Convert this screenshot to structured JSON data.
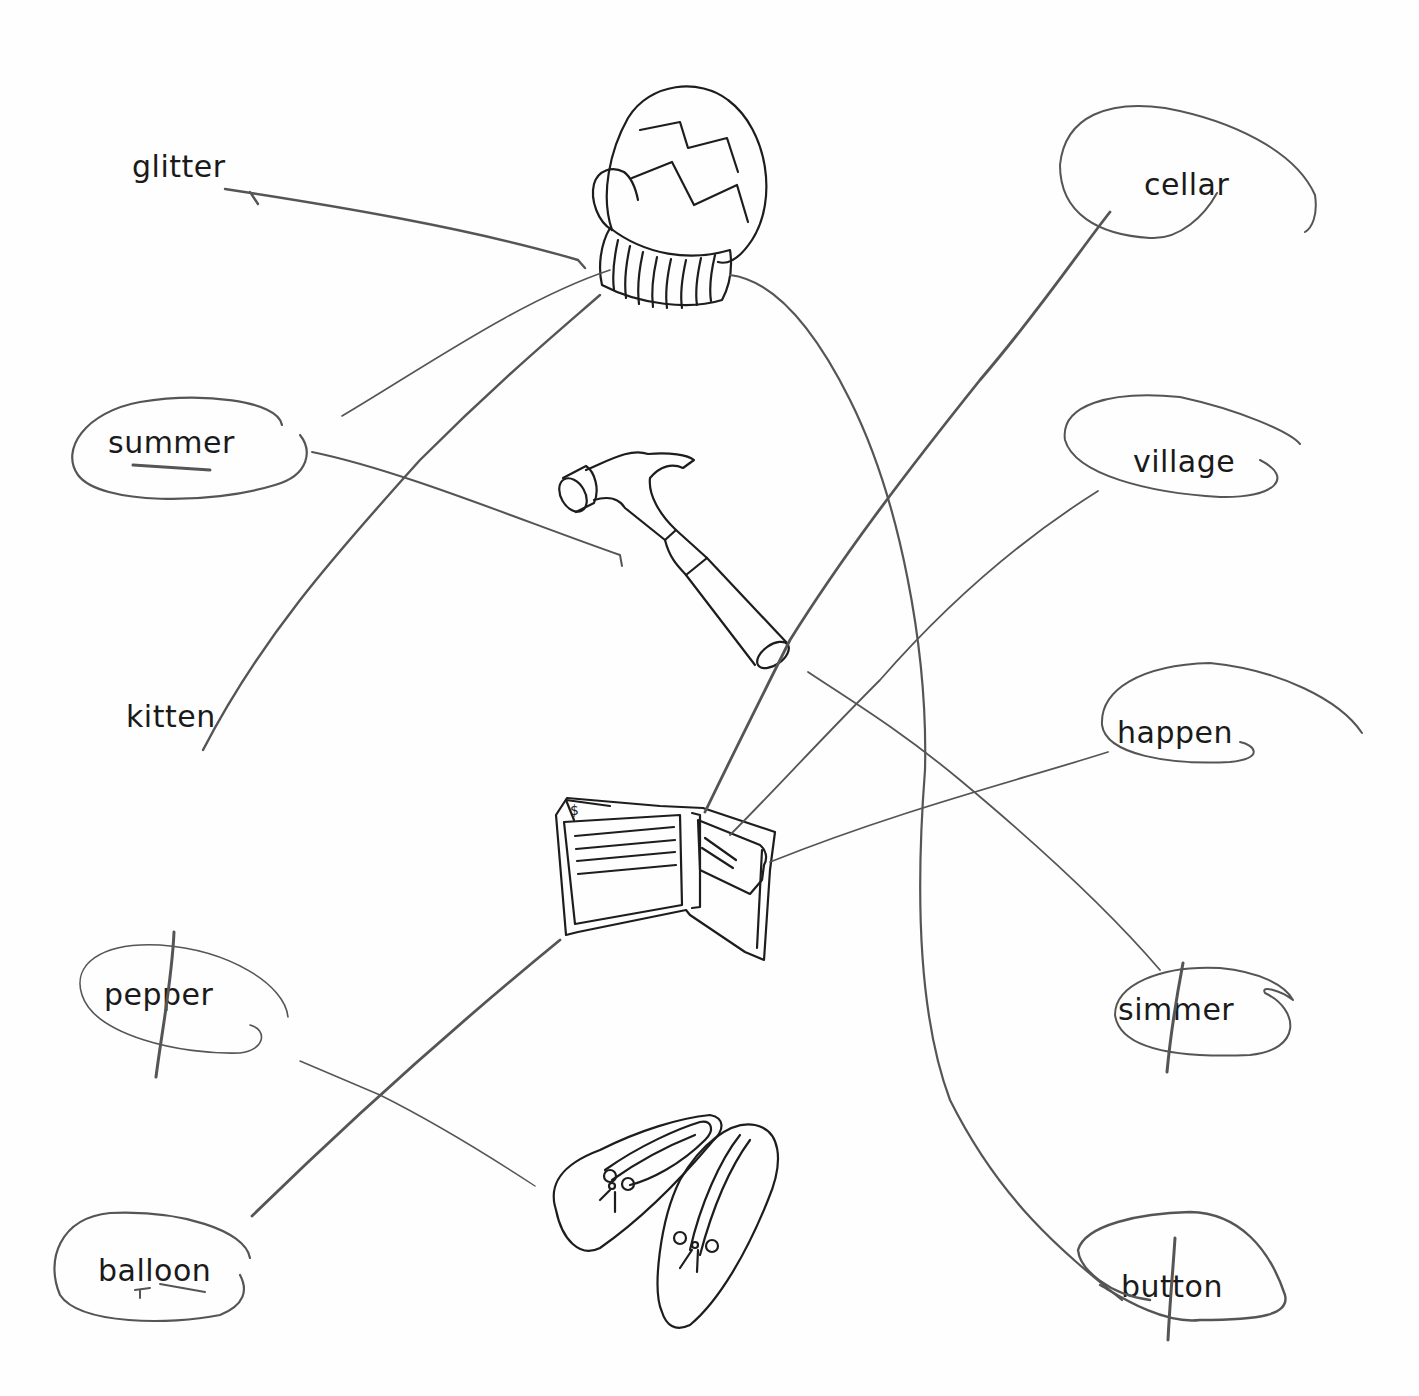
{
  "worksheet": {
    "left_words": [
      {
        "id": "glitter",
        "text": "glitter",
        "x": 132,
        "y": 152,
        "circled": false,
        "crossed": false
      },
      {
        "id": "summer",
        "text": "summer",
        "x": 108,
        "y": 428,
        "circled": true,
        "crossed": false,
        "underlined": true
      },
      {
        "id": "kitten",
        "text": "kitten",
        "x": 126,
        "y": 702,
        "circled": false,
        "crossed": false
      },
      {
        "id": "pepper",
        "text": "pepper",
        "x": 104,
        "y": 980,
        "circled": true,
        "crossed": true
      },
      {
        "id": "balloon",
        "text": "balloon",
        "x": 98,
        "y": 1256,
        "circled": true,
        "crossed": false,
        "underlined": true
      }
    ],
    "right_words": [
      {
        "id": "cellar",
        "text": "cellar",
        "x": 1144,
        "y": 170,
        "circled": true,
        "crossed": false
      },
      {
        "id": "village",
        "text": "village",
        "x": 1133,
        "y": 447,
        "circled": true,
        "crossed": false
      },
      {
        "id": "happen",
        "text": "happen",
        "x": 1117,
        "y": 718,
        "circled": true,
        "crossed": false
      },
      {
        "id": "simmer",
        "text": "simmer",
        "x": 1118,
        "y": 995,
        "circled": true,
        "crossed": true
      },
      {
        "id": "button",
        "text": "button",
        "x": 1121,
        "y": 1272,
        "circled": true,
        "crossed": true
      }
    ],
    "pictures": [
      {
        "id": "mitten",
        "label": "mitten picture"
      },
      {
        "id": "hammer",
        "label": "hammer picture"
      },
      {
        "id": "wallet",
        "label": "wallet picture"
      },
      {
        "id": "slippers",
        "label": "slippers picture"
      }
    ],
    "connections": [
      {
        "from": "glitter",
        "to": "mitten"
      },
      {
        "from": "summer",
        "to": "mitten"
      },
      {
        "from": "summer",
        "to": "hammer"
      },
      {
        "from": "kitten",
        "to": "mitten"
      },
      {
        "from": "pepper",
        "to": "slippers"
      },
      {
        "from": "balloon",
        "to": "wallet"
      },
      {
        "from": "cellar",
        "to": "wallet"
      },
      {
        "from": "village",
        "to": "wallet"
      },
      {
        "from": "happen",
        "to": "wallet"
      },
      {
        "from": "simmer",
        "to": "wallet"
      },
      {
        "from": "button",
        "to": "mitten"
      }
    ],
    "wallet_symbol": "$",
    "colors": {
      "paper": "#fefefe",
      "ink": "#1d1d1d",
      "pencil": "#555555"
    }
  }
}
